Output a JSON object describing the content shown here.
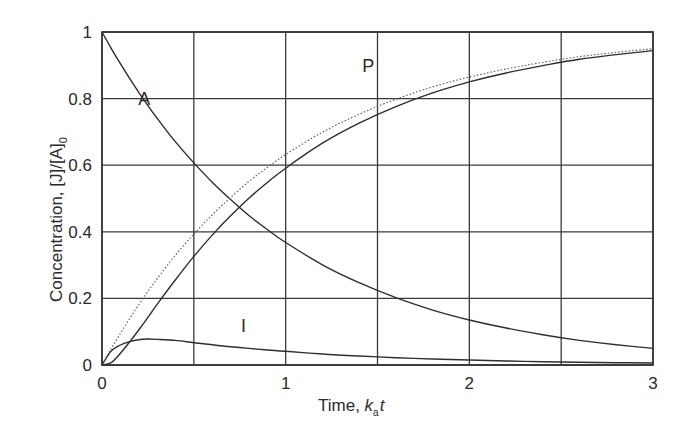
{
  "chart_data": {
    "type": "line",
    "title": "",
    "xlabel": "Time, k_a t",
    "xlabel_main": "Time, ",
    "xlabel_k": "k",
    "xlabel_sub": "a",
    "xlabel_t": "t",
    "ylabel": "Concentration, [J]/[A]_0",
    "ylabel_main": "Concentration, [J]/[A]",
    "ylabel_sub": "0",
    "xlim": [
      0,
      3
    ],
    "ylim": [
      0,
      1
    ],
    "grid": true,
    "legend": "none (curves labelled inline: A, I, P)",
    "x_ticks": [
      0,
      0.5,
      1,
      1.5,
      2,
      2.5,
      3
    ],
    "x_tick_labels": [
      "0",
      "",
      "1",
      "",
      "2",
      "",
      "3"
    ],
    "y_ticks": [
      0,
      0.2,
      0.4,
      0.6,
      0.8,
      1
    ],
    "y_tick_labels": [
      "0",
      "0.2",
      "0.4",
      "0.6",
      "0.8",
      "1"
    ],
    "x": [
      0,
      0.05,
      0.1,
      0.15,
      0.2,
      0.25,
      0.3,
      0.4,
      0.5,
      0.6,
      0.7,
      0.8,
      0.9,
      1.0,
      1.2,
      1.4,
      1.6,
      1.8,
      2.0,
      2.2,
      2.4,
      2.6,
      2.8,
      3.0
    ],
    "series": [
      {
        "name": "A",
        "style": "solid",
        "values": [
          1.0,
          0.951,
          0.905,
          0.861,
          0.819,
          0.779,
          0.741,
          0.67,
          0.607,
          0.549,
          0.497,
          0.449,
          0.407,
          0.368,
          0.301,
          0.247,
          0.202,
          0.165,
          0.135,
          0.111,
          0.091,
          0.074,
          0.061,
          0.05
        ]
      },
      {
        "name": "I",
        "style": "solid",
        "values": [
          0.0,
          0.042,
          0.06,
          0.07,
          0.076,
          0.078,
          0.077,
          0.074,
          0.067,
          0.061,
          0.055,
          0.05,
          0.045,
          0.041,
          0.033,
          0.027,
          0.022,
          0.018,
          0.015,
          0.012,
          0.01,
          0.008,
          0.007,
          0.006
        ]
      },
      {
        "name": "P",
        "style": "solid",
        "values": [
          0.0,
          0.007,
          0.035,
          0.069,
          0.105,
          0.143,
          0.182,
          0.256,
          0.326,
          0.39,
          0.448,
          0.501,
          0.548,
          0.591,
          0.666,
          0.726,
          0.776,
          0.817,
          0.85,
          0.877,
          0.899,
          0.918,
          0.932,
          0.944
        ]
      },
      {
        "name": "P (no intermediate, 1 - A)",
        "style": "dotted",
        "values": [
          0.0,
          0.049,
          0.095,
          0.139,
          0.181,
          0.221,
          0.259,
          0.33,
          0.393,
          0.451,
          0.503,
          0.551,
          0.593,
          0.632,
          0.699,
          0.753,
          0.798,
          0.835,
          0.865,
          0.889,
          0.909,
          0.926,
          0.939,
          0.95
        ]
      }
    ],
    "annotations": [
      {
        "text": "A",
        "x": 0.23,
        "y": 0.78
      },
      {
        "text": "P",
        "x": 1.45,
        "y": 0.88
      },
      {
        "text": "I",
        "x": 0.77,
        "y": 0.1
      }
    ]
  }
}
